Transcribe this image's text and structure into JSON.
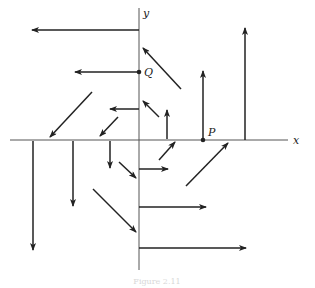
{
  "figure": {
    "caption": "Figure 2.11",
    "axes": {
      "x_label": "x",
      "y_label": "y",
      "origin_px": [
        139,
        140
      ],
      "x_range_px": [
        10,
        288
      ],
      "y_range_px": [
        8,
        270
      ]
    },
    "points": [
      {
        "label": "Q",
        "px": [
          139,
          72
        ]
      },
      {
        "label": "P",
        "px": [
          203,
          140
        ]
      }
    ],
    "vectors": [
      {
        "from": [
          139,
          30
        ],
        "to": [
          32,
          30
        ]
      },
      {
        "from": [
          139,
          72
        ],
        "to": [
          75,
          72
        ]
      },
      {
        "from": [
          139,
          109
        ],
        "to": [
          110,
          109
        ]
      },
      {
        "from": [
          92,
          92
        ],
        "to": [
          50,
          137
        ]
      },
      {
        "from": [
          118,
          117
        ],
        "to": [
          100,
          136
        ]
      },
      {
        "from": [
          181,
          89
        ],
        "to": [
          143,
          48
        ]
      },
      {
        "from": [
          159,
          117
        ],
        "to": [
          143,
          101
        ]
      },
      {
        "from": [
          167,
          139
        ],
        "to": [
          167,
          110
        ]
      },
      {
        "from": [
          203,
          140
        ],
        "to": [
          203,
          71
        ]
      },
      {
        "from": [
          245,
          140
        ],
        "to": [
          245,
          28
        ]
      },
      {
        "from": [
          33,
          141
        ],
        "to": [
          33,
          250
        ]
      },
      {
        "from": [
          73,
          141
        ],
        "to": [
          73,
          206
        ]
      },
      {
        "from": [
          110,
          141
        ],
        "to": [
          110,
          168
        ]
      },
      {
        "from": [
          119,
          162
        ],
        "to": [
          136,
          178
        ]
      },
      {
        "from": [
          93,
          189
        ],
        "to": [
          136,
          232
        ]
      },
      {
        "from": [
          139,
          169
        ],
        "to": [
          168,
          169
        ]
      },
      {
        "from": [
          139,
          207
        ],
        "to": [
          206,
          207
        ]
      },
      {
        "from": [
          139,
          248
        ],
        "to": [
          246,
          248
        ]
      },
      {
        "from": [
          159,
          160
        ],
        "to": [
          175,
          142
        ]
      },
      {
        "from": [
          186,
          186
        ],
        "to": [
          228,
          143
        ]
      }
    ],
    "colors": {
      "ink": "#222222",
      "axis": "#555555",
      "caption": "#d8d8d8"
    }
  }
}
